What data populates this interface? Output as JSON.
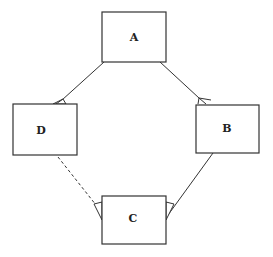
{
  "diagram": {
    "type": "graph",
    "colors": {
      "stroke": "#333333",
      "background": "#ffffff",
      "text": "#222222"
    },
    "nodes": [
      {
        "id": "A",
        "label": "A",
        "x": 102,
        "y": 12,
        "w": 64,
        "h": 50
      },
      {
        "id": "D",
        "label": "D",
        "x": 13,
        "y": 104,
        "w": 64,
        "h": 51
      },
      {
        "id": "B",
        "label": "B",
        "x": 196,
        "y": 105,
        "w": 63,
        "h": 48
      },
      {
        "id": "C",
        "label": "C",
        "x": 102,
        "y": 196,
        "w": 64,
        "h": 48
      }
    ],
    "edges": [
      {
        "from": "A",
        "to": "D",
        "style": "solid",
        "arrowhead": "open-triangle-at-D"
      },
      {
        "from": "A",
        "to": "B",
        "style": "solid",
        "arrowhead": "open-arrow-at-B"
      },
      {
        "from": "B",
        "to": "C",
        "style": "solid",
        "arrowhead": "open-triangle-at-C"
      },
      {
        "from": "D",
        "to": "C",
        "style": "dashed",
        "arrowhead": "open-triangle-at-C"
      }
    ]
  }
}
